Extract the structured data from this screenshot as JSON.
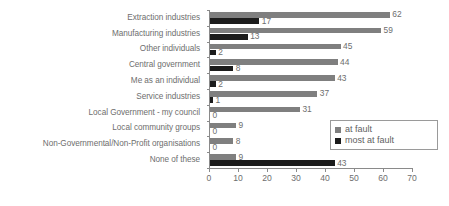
{
  "chart_data": {
    "type": "bar",
    "orientation": "horizontal",
    "title": "",
    "subtitle": "",
    "xlabel": "",
    "ylabel": "",
    "xlim": [
      0,
      70
    ],
    "xticks": [
      0,
      10,
      20,
      30,
      40,
      50,
      60,
      70
    ],
    "grid": false,
    "legend_position": "bottom-right-inside",
    "categories": [
      "Extraction industries",
      "Manufacturing industries",
      "Other individuals",
      "Central government",
      "Me as an individual",
      "Service industries",
      "Local Government - my council",
      "Local community groups",
      "Non-Governmental/Non-Profit organisations",
      "None of these"
    ],
    "series": [
      {
        "name": "at fault",
        "color": "#7f7f7f",
        "values": [
          62,
          59,
          45,
          44,
          43,
          37,
          31,
          9,
          8,
          9
        ]
      },
      {
        "name": "most at fault",
        "color": "#1c1c1c",
        "values": [
          17,
          13,
          2,
          8,
          2,
          1,
          0,
          0,
          0,
          43
        ]
      }
    ]
  },
  "legend": {
    "items": [
      {
        "label": "at fault",
        "color": "#7f7f7f"
      },
      {
        "label": "most at fault",
        "color": "#1c1c1c"
      }
    ]
  }
}
